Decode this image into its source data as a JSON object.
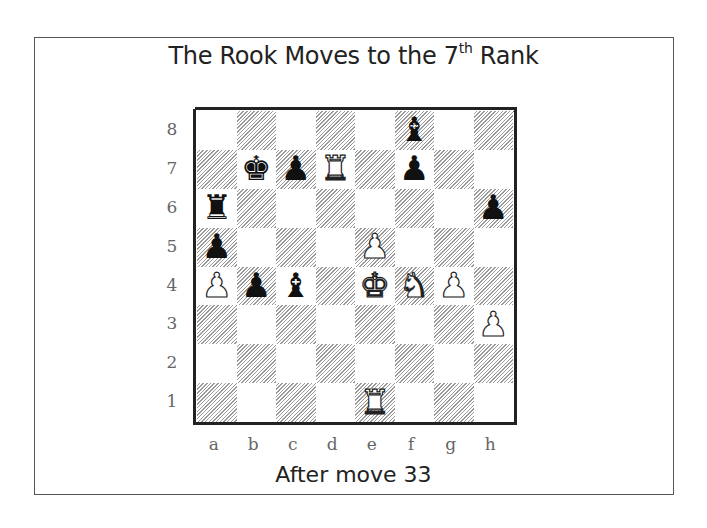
{
  "title": {
    "main": "The Rook Moves to the 7",
    "superscript": "th",
    "suffix": " Rank"
  },
  "caption": "After move 33",
  "colors": {
    "frame": "#555555",
    "hatch": "#9a9a9a",
    "label": "#666666",
    "text": "#222222"
  },
  "board": {
    "ranks": [
      "8",
      "7",
      "6",
      "5",
      "4",
      "3",
      "2",
      "1"
    ],
    "files": [
      "a",
      "b",
      "c",
      "d",
      "e",
      "f",
      "g",
      "h"
    ],
    "squares": [
      [
        "",
        "",
        "",
        "",
        "",
        "b",
        "",
        ""
      ],
      [
        "",
        "k",
        "p",
        "R",
        "",
        "p",
        "",
        ""
      ],
      [
        "r",
        "",
        "",
        "",
        "",
        "",
        "",
        "p"
      ],
      [
        "p",
        "",
        "",
        "",
        "P",
        "",
        "",
        ""
      ],
      [
        "P",
        "p",
        "b",
        "",
        "K",
        "N",
        "P",
        ""
      ],
      [
        "",
        "",
        "",
        "",
        "",
        "",
        "",
        "P"
      ],
      [
        "",
        "",
        "",
        "",
        "",
        "",
        "",
        ""
      ],
      [
        "",
        "",
        "",
        "",
        "R",
        "",
        "",
        ""
      ]
    ],
    "pieces": [
      {
        "square": "f8",
        "piece": "bishop",
        "color": "black"
      },
      {
        "square": "b7",
        "piece": "king",
        "color": "black"
      },
      {
        "square": "c7",
        "piece": "pawn",
        "color": "black"
      },
      {
        "square": "d7",
        "piece": "rook",
        "color": "white"
      },
      {
        "square": "f7",
        "piece": "pawn",
        "color": "black"
      },
      {
        "square": "a6",
        "piece": "rook",
        "color": "black"
      },
      {
        "square": "h6",
        "piece": "pawn",
        "color": "black"
      },
      {
        "square": "a5",
        "piece": "pawn",
        "color": "black"
      },
      {
        "square": "e5",
        "piece": "pawn",
        "color": "white"
      },
      {
        "square": "a4",
        "piece": "pawn",
        "color": "white"
      },
      {
        "square": "b4",
        "piece": "pawn",
        "color": "black"
      },
      {
        "square": "c4",
        "piece": "bishop",
        "color": "black"
      },
      {
        "square": "e4",
        "piece": "king",
        "color": "white"
      },
      {
        "square": "f4",
        "piece": "knight",
        "color": "white"
      },
      {
        "square": "g4",
        "piece": "pawn",
        "color": "white"
      },
      {
        "square": "h3",
        "piece": "pawn",
        "color": "white"
      },
      {
        "square": "e1",
        "piece": "rook",
        "color": "white"
      }
    ]
  }
}
